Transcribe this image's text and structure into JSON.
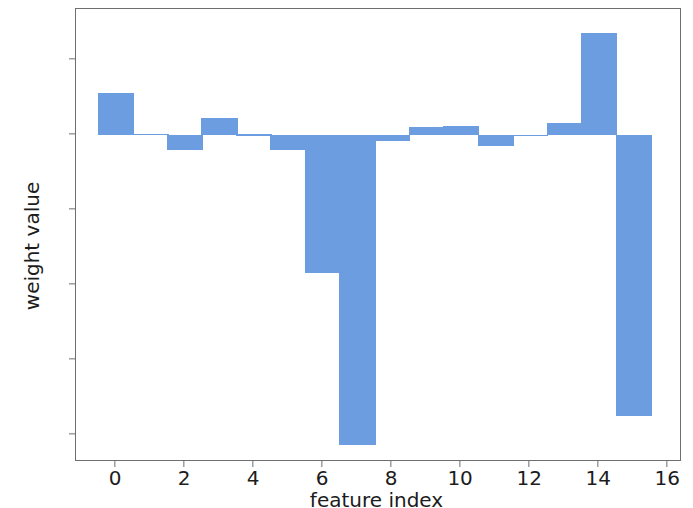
{
  "chart_data": {
    "type": "bar",
    "title": "",
    "xlabel": "feature index",
    "ylabel": "weight value",
    "categories": [
      0,
      1,
      2,
      3,
      4,
      5,
      6,
      7,
      8,
      9,
      10,
      11,
      12,
      13,
      14,
      15
    ],
    "values": [
      1.1,
      0.02,
      -0.4,
      0.45,
      0.01,
      -0.4,
      -3.68,
      -8.27,
      -0.18,
      0.2,
      0.22,
      -0.3,
      0.0,
      0.3,
      2.7,
      -7.5
    ],
    "xlim": [
      -1.16,
      16.4
    ],
    "ylim": [
      -8.73,
      3.35
    ],
    "xticks": [
      0,
      2,
      4,
      6,
      8,
      10,
      12,
      14,
      16
    ],
    "xtick_labels": [
      "0",
      "2",
      "4",
      "6",
      "8",
      "10",
      "12",
      "14",
      "16"
    ],
    "yticks": [
      2,
      0,
      -2,
      -4,
      -6,
      -8
    ],
    "ytick_labels": [
      "2",
      "0",
      "−2",
      "−4",
      "−6",
      "−8"
    ],
    "grid": false,
    "legend": null,
    "bar_color": "#6b9de0",
    "bar_width": 1.05,
    "background_color": "#ffffff",
    "axis_color": "#6e6e6e",
    "text_color": "#1c1c1c"
  }
}
